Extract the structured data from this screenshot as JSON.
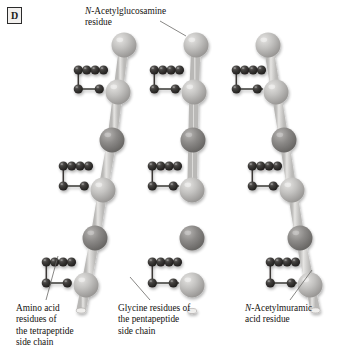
{
  "figure": {
    "panel_label": "D",
    "background_color": "#ffffff"
  },
  "labels": {
    "nag": {
      "italic_prefix": "N",
      "rest": "-Acetylglucosamine",
      "line2": "residue"
    },
    "amino_acid": {
      "line1": "Amino acid",
      "line2": "residues of",
      "line3": "the tetrapeptide",
      "line4": "side chain"
    },
    "glycine": {
      "line1": "Glycine residues of",
      "line2": "the pentapeptide",
      "line3": "side chain"
    },
    "nam": {
      "italic_prefix": "N",
      "rest": "-Acetylmuramic",
      "line2": "acid residue"
    }
  },
  "colors": {
    "nag_sphere": "#c0bfbd",
    "nag_sphere_dark": "#9a9896",
    "nam_sphere": "#8a8886",
    "nam_sphere_dark": "#6b6967",
    "amino_sphere": "#3c3a38",
    "amino_sphere_dark": "#232120",
    "bond_tube": "#cfcecc",
    "bond_line": "#3a3836",
    "leader_line": "#6a6866",
    "text": "#14110f"
  },
  "structure": {
    "glycan_strands": [
      {
        "id": "strand-left",
        "x_top": 120,
        "x_bottom": 82,
        "residues": [
          {
            "type": "NAG",
            "x": 124,
            "y": 45
          },
          {
            "type": "NAG",
            "x": 118,
            "y": 92
          },
          {
            "type": "NAM",
            "x": 112,
            "y": 140
          },
          {
            "type": "NAG",
            "x": 103,
            "y": 190
          },
          {
            "type": "NAM",
            "x": 95,
            "y": 238
          },
          {
            "type": "NAG",
            "x": 86,
            "y": 285
          }
        ]
      },
      {
        "id": "strand-middle",
        "x_top": 196,
        "x_bottom": 196,
        "residues": [
          {
            "type": "NAG",
            "x": 196,
            "y": 45
          },
          {
            "type": "NAG",
            "x": 194,
            "y": 92
          },
          {
            "type": "NAM",
            "x": 193,
            "y": 140
          },
          {
            "type": "NAG",
            "x": 192,
            "y": 190
          },
          {
            "type": "NAM",
            "x": 192,
            "y": 238
          },
          {
            "type": "NAG",
            "x": 192,
            "y": 285
          }
        ]
      },
      {
        "id": "strand-right",
        "x_top": 268,
        "x_bottom": 310,
        "residues": [
          {
            "type": "NAG",
            "x": 268,
            "y": 45
          },
          {
            "type": "NAG",
            "x": 276,
            "y": 92
          },
          {
            "type": "NAM",
            "x": 284,
            "y": 140
          },
          {
            "type": "NAG",
            "x": 292,
            "y": 190
          },
          {
            "type": "NAM",
            "x": 300,
            "y": 238
          },
          {
            "type": "NAG",
            "x": 310,
            "y": 285
          }
        ]
      }
    ],
    "crosslink_rows": [
      {
        "id": "crosslink-row-top",
        "tetra_y": 70,
        "gly_y": 89
      },
      {
        "id": "crosslink-row-middle",
        "tetra_y": 166,
        "gly_y": 186
      },
      {
        "id": "crosslink-row-bottom",
        "tetra_y": 262,
        "gly_y": 283
      }
    ],
    "tetrapeptide_count": 4,
    "pentapeptide_glycine_count": 5
  }
}
